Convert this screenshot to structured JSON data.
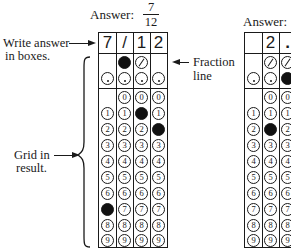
{
  "example1": {
    "answer_label": "Answer:",
    "fraction_numerator": "7",
    "fraction_denominator": "12",
    "boxes": [
      "7",
      "/",
      "1",
      "2"
    ],
    "fraction_row": [
      null,
      "filled",
      "slash",
      null
    ],
    "decimal_row": [
      "dot",
      "dot",
      "dot",
      "dot"
    ],
    "digits": [
      "0",
      "1",
      "2",
      "3",
      "4",
      "5",
      "6",
      "7",
      "8",
      "9"
    ],
    "filled_digits": {
      "0": "7",
      "2": "1",
      "3": "2"
    },
    "column0_has_zero": false
  },
  "example2": {
    "answer_label": "Answer:",
    "boxes": [
      "",
      "2",
      "."
    ],
    "fraction_row": [
      null,
      "slash",
      "slash"
    ],
    "decimal_row": [
      "dot",
      "dot",
      "filled"
    ],
    "filled_digits": {
      "1": "2"
    }
  },
  "annotations": {
    "write_answer_line1": "Write answer",
    "write_answer_line2": "in boxes.",
    "fraction_line_line1": "Fraction",
    "fraction_line_line2": "line",
    "grid_in_line1": "Grid in",
    "grid_in_line2": "result."
  },
  "colors": {
    "ink": "#1a1a1a",
    "paper": "#ffffff"
  }
}
